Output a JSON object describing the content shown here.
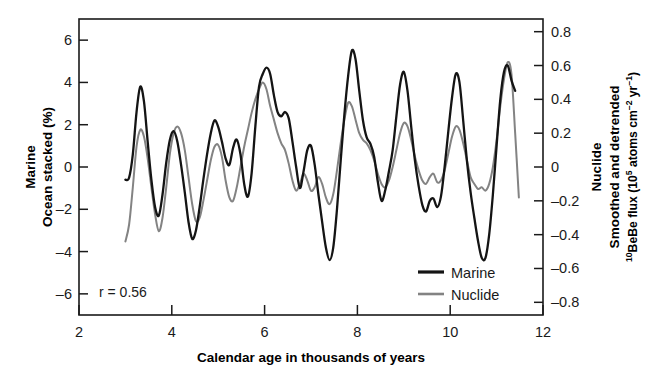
{
  "chart_data": {
    "type": "line",
    "title": "",
    "xlabel": "Calendar age in thousands of years",
    "xlim": [
      2,
      12
    ],
    "xticks": [
      2,
      4,
      6,
      8,
      10,
      12
    ],
    "xticklabels": [
      "2",
      "4",
      "6",
      "8",
      "10",
      "12"
    ],
    "grid": false,
    "legend_position": "bottom-right",
    "annotation": "r = 0.56",
    "left_axis": {
      "label_line1": "Marine",
      "label_line2": "Ocean stacked (%)",
      "ylim": [
        -7,
        7
      ],
      "yticks": [
        6,
        4,
        2,
        0,
        -2,
        -4,
        -6
      ],
      "yticklabels": [
        "6",
        "4",
        "2",
        "0",
        "–2",
        "–4",
        "–6"
      ]
    },
    "right_axis": {
      "label_line1": "Nuclide",
      "label_line2": "Smoothed and detrended",
      "label_line3_pre": "Be flux (10",
      "label_line3_sup1": "10",
      "label_line3_sup2": "5",
      "label_line3_mid": " atoms cm",
      "label_line3_sup3": "–2",
      "label_line3_mid2": " yr",
      "label_line3_sup4": "–1",
      "label_line3_post": ")",
      "ylim": [
        -0.875,
        0.875
      ],
      "yticks": [
        0.8,
        0.6,
        0.4,
        0.2,
        0,
        -0.2,
        -0.4,
        -0.6,
        -0.8
      ],
      "yticklabels": [
        "0.8",
        "0.6",
        "0.4",
        "0.2",
        "0",
        "–0.2",
        "–0.4",
        "–0.6",
        "–0.8"
      ]
    },
    "series": [
      {
        "name": "Marine",
        "color": "#141414",
        "axis": "left",
        "x": [
          3.0,
          3.08,
          3.16,
          3.24,
          3.32,
          3.4,
          3.48,
          3.56,
          3.64,
          3.72,
          3.8,
          3.88,
          3.96,
          4.04,
          4.12,
          4.2,
          4.28,
          4.36,
          4.44,
          4.52,
          4.6,
          4.68,
          4.76,
          4.84,
          4.92,
          5.0,
          5.08,
          5.16,
          5.24,
          5.32,
          5.4,
          5.48,
          5.56,
          5.64,
          5.72,
          5.8,
          5.88,
          5.96,
          6.04,
          6.12,
          6.2,
          6.28,
          6.36,
          6.44,
          6.52,
          6.6,
          6.68,
          6.76,
          6.84,
          6.92,
          7.0,
          7.08,
          7.16,
          7.24,
          7.32,
          7.4,
          7.48,
          7.56,
          7.64,
          7.72,
          7.8,
          7.88,
          7.96,
          8.04,
          8.12,
          8.2,
          8.28,
          8.36,
          8.44,
          8.52,
          8.6,
          8.68,
          8.76,
          8.84,
          8.92,
          9.0,
          9.08,
          9.16,
          9.24,
          9.32,
          9.4,
          9.48,
          9.56,
          9.64,
          9.72,
          9.8,
          9.88,
          9.96,
          10.04,
          10.12,
          10.2,
          10.28,
          10.36,
          10.44,
          10.52,
          10.6,
          10.68,
          10.76,
          10.84,
          10.92,
          11.0,
          11.08,
          11.16,
          11.24,
          11.32,
          11.4
        ],
        "y": [
          -0.6,
          -0.5,
          0.6,
          2.6,
          3.8,
          3.1,
          1.2,
          -0.6,
          -1.9,
          -2.3,
          -1.3,
          0.2,
          1.3,
          1.7,
          1.2,
          0.1,
          -1.2,
          -2.6,
          -3.4,
          -3.0,
          -1.9,
          -0.6,
          0.6,
          1.6,
          2.2,
          1.9,
          1.2,
          0.4,
          0.1,
          0.9,
          1.3,
          0.6,
          -0.8,
          -1.4,
          -0.3,
          1.9,
          3.8,
          4.4,
          4.7,
          4.4,
          3.4,
          2.6,
          2.4,
          2.6,
          2.3,
          1.2,
          0.0,
          -1.0,
          -0.2,
          0.8,
          1.0,
          0.1,
          -1.3,
          -2.6,
          -3.8,
          -4.4,
          -3.8,
          -2.0,
          0.3,
          2.5,
          4.3,
          5.5,
          5.1,
          3.6,
          2.2,
          1.4,
          1.1,
          0.5,
          -0.7,
          -1.6,
          -1.1,
          -0.2,
          0.8,
          2.4,
          3.9,
          4.5,
          3.6,
          1.9,
          0.3,
          -0.9,
          -1.8,
          -2.1,
          -1.6,
          -1.5,
          -1.9,
          -1.4,
          0.0,
          1.7,
          3.3,
          4.4,
          4.0,
          2.2,
          0.3,
          -1.2,
          -2.4,
          -3.5,
          -4.3,
          -4.3,
          -3.2,
          -1.3,
          1.0,
          3.2,
          4.5,
          4.8,
          4.1,
          3.6
        ]
      },
      {
        "name": "Nuclide",
        "color": "#838383",
        "axis": "right",
        "x": [
          3.0,
          3.08,
          3.16,
          3.24,
          3.32,
          3.4,
          3.48,
          3.56,
          3.64,
          3.72,
          3.8,
          3.88,
          3.96,
          4.04,
          4.12,
          4.2,
          4.28,
          4.36,
          4.44,
          4.52,
          4.6,
          4.68,
          4.76,
          4.84,
          4.92,
          5.0,
          5.08,
          5.16,
          5.24,
          5.32,
          5.4,
          5.48,
          5.56,
          5.64,
          5.72,
          5.8,
          5.88,
          5.96,
          6.04,
          6.12,
          6.2,
          6.28,
          6.36,
          6.44,
          6.52,
          6.6,
          6.68,
          6.76,
          6.84,
          6.92,
          7.0,
          7.08,
          7.16,
          7.24,
          7.32,
          7.4,
          7.48,
          7.56,
          7.64,
          7.72,
          7.8,
          7.88,
          7.96,
          8.04,
          8.12,
          8.2,
          8.28,
          8.36,
          8.44,
          8.52,
          8.6,
          8.68,
          8.76,
          8.84,
          8.92,
          9.0,
          9.08,
          9.16,
          9.24,
          9.32,
          9.4,
          9.48,
          9.56,
          9.64,
          9.72,
          9.8,
          9.88,
          9.96,
          10.04,
          10.12,
          10.2,
          10.28,
          10.36,
          10.44,
          10.52,
          10.6,
          10.68,
          10.76,
          10.84,
          10.92,
          11.0,
          11.08,
          11.16,
          11.24,
          11.32,
          11.4,
          11.48
        ],
        "y": [
          -0.44,
          -0.34,
          -0.12,
          0.12,
          0.22,
          0.18,
          0.05,
          -0.12,
          -0.28,
          -0.38,
          -0.3,
          -0.12,
          0.08,
          0.2,
          0.24,
          0.2,
          0.1,
          -0.06,
          -0.22,
          -0.32,
          -0.3,
          -0.2,
          -0.08,
          0.04,
          0.12,
          0.13,
          0.06,
          -0.08,
          -0.18,
          -0.2,
          -0.12,
          0.0,
          0.12,
          0.22,
          0.32,
          0.4,
          0.46,
          0.5,
          0.46,
          0.36,
          0.28,
          0.2,
          0.14,
          0.1,
          0.02,
          -0.08,
          -0.14,
          -0.1,
          -0.04,
          -0.08,
          -0.14,
          -0.12,
          -0.06,
          -0.1,
          -0.18,
          -0.22,
          -0.16,
          -0.02,
          0.14,
          0.28,
          0.38,
          0.36,
          0.28,
          0.2,
          0.16,
          0.14,
          0.1,
          0.04,
          -0.04,
          -0.1,
          -0.12,
          -0.08,
          0.0,
          0.1,
          0.2,
          0.26,
          0.24,
          0.16,
          0.06,
          -0.02,
          -0.08,
          -0.1,
          -0.06,
          -0.04,
          -0.09,
          -0.08,
          -0.02,
          0.08,
          0.18,
          0.24,
          0.22,
          0.14,
          0.04,
          -0.06,
          -0.1,
          -0.13,
          -0.12,
          -0.14,
          -0.1,
          0.0,
          0.16,
          0.36,
          0.52,
          0.62,
          0.55,
          0.2,
          -0.18
        ]
      }
    ]
  },
  "legend": {
    "items": [
      {
        "label": "Marine",
        "color": "#141414"
      },
      {
        "label": "Nuclide",
        "color": "#838383"
      }
    ]
  }
}
